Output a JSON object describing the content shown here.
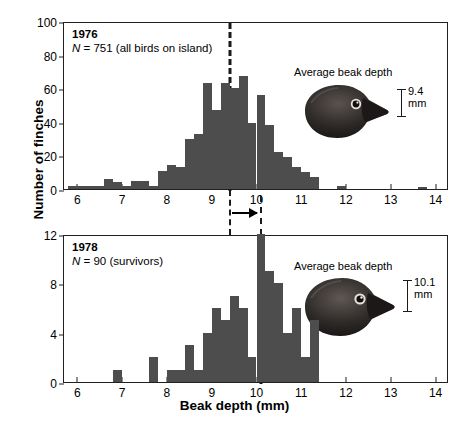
{
  "figure": {
    "xlabel": "Beak depth (mm)",
    "ylabel": "Number of finches"
  },
  "panels": [
    {
      "year": "1976",
      "n_label": "N = 751 (all birds on island)",
      "beak_caption": "Average beak depth",
      "beak_value": "9.4",
      "beak_unit": "mm",
      "mean": 9.4
    },
    {
      "year": "1978",
      "n_label": "N = 90 (survivors)",
      "beak_caption": "Average beak depth",
      "beak_value": "10.1",
      "beak_unit": "mm",
      "mean": 10.1
    }
  ],
  "chart_data": [
    {
      "type": "bar",
      "title": "1976",
      "subtitle": "N = 751 (all birds on island)",
      "xlabel": "Beak depth (mm)",
      "ylabel": "Number of finches",
      "xlim": [
        5.7,
        14.3
      ],
      "ylim": [
        0,
        100
      ],
      "yticks": [
        0,
        20,
        40,
        60,
        80,
        100
      ],
      "xticks": [
        6,
        7,
        8,
        9,
        10,
        11,
        12,
        13,
        14
      ],
      "grid": false,
      "legend": null,
      "bin_width": 0.2,
      "bin_starts": [
        5.8,
        6.0,
        6.2,
        6.4,
        6.6,
        6.8,
        7.0,
        7.2,
        7.4,
        7.6,
        7.8,
        8.0,
        8.2,
        8.4,
        8.6,
        8.8,
        9.0,
        9.2,
        9.4,
        9.6,
        9.8,
        10.0,
        10.2,
        10.4,
        10.6,
        10.8,
        11.0,
        11.2,
        11.8,
        13.6
      ],
      "values": [
        2,
        2,
        2,
        2,
        6,
        4,
        2,
        5,
        5,
        2,
        11,
        14,
        13,
        30,
        33,
        63,
        47,
        63,
        60,
        67,
        39,
        56,
        38,
        22,
        19,
        13,
        10,
        7,
        2,
        1
      ],
      "annotations": [
        {
          "label": "mean",
          "x": 9.4,
          "style": "dashed-vertical"
        },
        {
          "label": "Average beak depth",
          "value": "9.4 mm"
        }
      ]
    },
    {
      "type": "bar",
      "title": "1978",
      "subtitle": "N = 90 (survivors)",
      "xlabel": "Beak depth (mm)",
      "ylabel": "Number of finches",
      "xlim": [
        5.7,
        14.3
      ],
      "ylim": [
        0,
        12
      ],
      "yticks": [
        0,
        4,
        8,
        12
      ],
      "xticks": [
        6,
        7,
        8,
        9,
        10,
        11,
        12,
        13,
        14
      ],
      "grid": false,
      "legend": null,
      "bin_width": 0.2,
      "bin_starts": [
        6.8,
        7.6,
        8.0,
        8.2,
        8.4,
        8.6,
        8.8,
        9.0,
        9.2,
        9.4,
        9.6,
        9.8,
        10.0,
        10.2,
        10.4,
        10.6,
        10.8,
        11.0,
        11.2
      ],
      "values": [
        1,
        2,
        1,
        1,
        3,
        1,
        4,
        6,
        5,
        7,
        6,
        2,
        12,
        9,
        8,
        4,
        6,
        2,
        5
      ],
      "annotations": [
        {
          "label": "mean",
          "x": 10.1,
          "style": "dashed-vertical"
        },
        {
          "label": "Average beak depth",
          "value": "10.1 mm"
        },
        {
          "label": "selection-shift-arrow",
          "from": 9.4,
          "to": 10.1
        }
      ]
    }
  ]
}
